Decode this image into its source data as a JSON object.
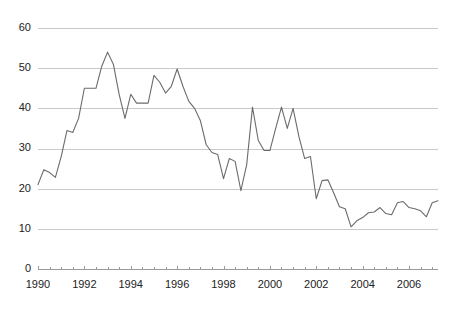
{
  "chart_data": {
    "type": "line",
    "title": "",
    "subtitle": "",
    "xlabel": "",
    "ylabel": "",
    "xlim": [
      1990.0,
      2007.25
    ],
    "ylim": [
      0,
      62
    ],
    "grid": true,
    "legend": null,
    "legend_position": "none",
    "line_color": "#6b6b6b",
    "grid_color": "#c9c9c9",
    "axis_color": "#9a9a9a",
    "text_color": "#222222",
    "background_color": "#ffffff",
    "y_ticks": [
      0,
      10,
      20,
      30,
      40,
      50,
      60
    ],
    "y_tick_labels": [
      "0",
      "10",
      "20",
      "30",
      "40",
      "50",
      "60"
    ],
    "x_ticks": [
      1990,
      1992,
      1994,
      1996,
      1998,
      2000,
      2002,
      2004,
      2006
    ],
    "x_tick_labels": [
      "1990",
      "1992",
      "1994",
      "1996",
      "1998",
      "2000",
      "2002",
      "2004",
      "2006"
    ],
    "x_minor_tick_interval": 0.5,
    "series": [
      {
        "name": "series-1",
        "x": [
          1990.0,
          1990.25,
          1990.5,
          1990.75,
          1991.0,
          1991.25,
          1991.5,
          1991.75,
          1992.0,
          1992.25,
          1992.5,
          1992.75,
          1993.0,
          1993.25,
          1993.5,
          1993.75,
          1994.0,
          1994.25,
          1994.5,
          1994.75,
          1995.0,
          1995.25,
          1995.5,
          1995.75,
          1996.0,
          1996.25,
          1996.5,
          1996.75,
          1997.0,
          1997.25,
          1997.5,
          1997.75,
          1998.0,
          1998.25,
          1998.5,
          1998.75,
          1999.0,
          1999.25,
          1999.5,
          1999.75,
          2000.0,
          2000.25,
          2000.5,
          2000.75,
          2001.0,
          2001.25,
          2001.5,
          2001.75,
          2002.0,
          2002.25,
          2002.5,
          2002.75,
          2003.0,
          2003.25,
          2003.5,
          2003.75,
          2004.0,
          2004.25,
          2004.5,
          2004.75,
          2005.0,
          2005.25,
          2005.5,
          2005.75,
          2006.0,
          2006.25,
          2006.5,
          2006.75,
          2007.0,
          2007.25
        ],
        "values": [
          21.0,
          24.7,
          24.0,
          22.8,
          28.0,
          34.5,
          34.0,
          37.5,
          45.0,
          45.0,
          45.0,
          50.5,
          54.0,
          51.0,
          43.5,
          37.5,
          43.5,
          41.3,
          41.3,
          41.3,
          48.2,
          46.5,
          43.8,
          45.5,
          49.8,
          45.5,
          41.8,
          40.0,
          37.0,
          31.0,
          29.0,
          28.5,
          22.5,
          27.5,
          26.8,
          19.5,
          26.0,
          40.3,
          32.0,
          29.5,
          29.5,
          35.0,
          40.3,
          35.0,
          40.0,
          33.0,
          27.5,
          28.0,
          17.5,
          22.0,
          22.2,
          19.0,
          15.5,
          15.0,
          10.5,
          12.0,
          12.8,
          14.0,
          14.2,
          15.3,
          13.8,
          13.5,
          16.5,
          16.8,
          15.3,
          15.0,
          14.5,
          13.0,
          16.5,
          17.0
        ]
      }
    ]
  }
}
